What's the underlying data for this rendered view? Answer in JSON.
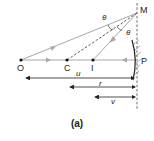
{
  "figure": {
    "caption": "(a)",
    "points": {
      "O": "O",
      "C": "C",
      "I": "I",
      "P": "P",
      "M": "M"
    },
    "angle_labels": [
      "θ",
      "θ"
    ],
    "distance_labels": {
      "u": "u",
      "r": "r",
      "v": "v"
    },
    "colors": {
      "ray": "#a8a8a8",
      "line": "#222222",
      "dashed": "#444444",
      "mirror_hatch": "#777777"
    }
  }
}
